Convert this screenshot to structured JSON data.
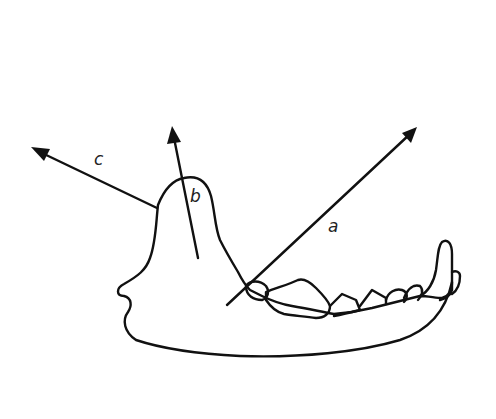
{
  "diagram": {
    "colors": {
      "line": "#111111",
      "background": "#ffffff",
      "label": "#222222"
    },
    "vectors": [
      {
        "label": "a",
        "from": [
          227,
          305
        ],
        "to": [
          416,
          128
        ],
        "label_pos": [
          328,
          218
        ]
      },
      {
        "label": "b",
        "from": [
          198,
          258
        ],
        "to": [
          172,
          127
        ],
        "label_pos": [
          190,
          188
        ]
      },
      {
        "label": "c",
        "from": [
          157,
          208
        ],
        "to": [
          32,
          148
        ],
        "label_pos": [
          94,
          151
        ]
      }
    ]
  }
}
